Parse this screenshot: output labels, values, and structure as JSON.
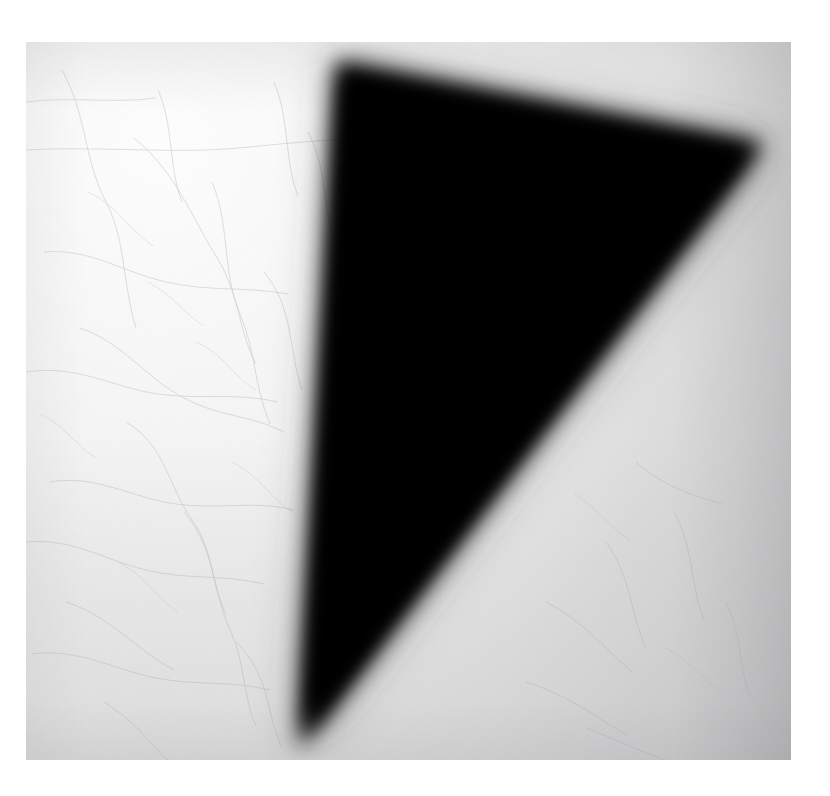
{
  "canvas": {
    "width": 830,
    "height": 796,
    "background_color": "#ffffff"
  },
  "artwork": {
    "title": "Black Triangle",
    "medium": "photographic print",
    "plate": {
      "x": 26,
      "y": 42,
      "width": 765,
      "height": 718,
      "paper_color_light": "#f2f2f2",
      "paper_color_mid": "#e4e4e5",
      "paper_color_dark": "#c8c8cb",
      "surface_texture": "craquelure-hairlines"
    },
    "figure": {
      "name": "black-triangle",
      "shape": "triangle",
      "fill_color": "#000000",
      "edge_softness_px": 20,
      "vertices": [
        {
          "label": "top-left-apex",
          "x": 337,
          "y": 62
        },
        {
          "label": "right-apex",
          "x": 763,
          "y": 144
        },
        {
          "label": "bottom-apex",
          "x": 300,
          "y": 748
        }
      ]
    },
    "lighting": {
      "brightest_region": "upper-left",
      "darkest_region": "right-edge",
      "vignette": true
    }
  }
}
